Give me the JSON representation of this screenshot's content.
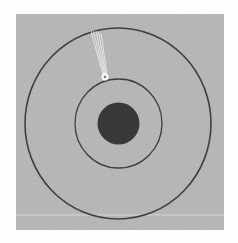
{
  "diagram": {
    "type": "orbit-diagram",
    "colors": {
      "page_background": "#fdfdfd",
      "panel": "#b6b6b6",
      "ring": "#3f3f3f",
      "nucleus": "#393939",
      "particle_glow": "#ffffff",
      "particle_core": "#8a8a8a",
      "streak": "#f2f2f2",
      "scan_line": "#d4d4d4"
    },
    "panel": {
      "x": 16,
      "y": 14,
      "width": 208,
      "height": 216
    },
    "nucleus": {
      "cx": 118.5,
      "cy": 123.5,
      "r": 21
    },
    "inner_orbit": {
      "cx": 118.5,
      "cy": 123.5,
      "rx": 43.5,
      "ry": 44.5,
      "stroke_width": 1.3
    },
    "outer_orbit": {
      "cx": 118,
      "cy": 123.5,
      "rx": 93,
      "ry": 95.5,
      "stroke_width": 1.6
    },
    "particle": {
      "cx": 105,
      "cy": 77,
      "glow_r": 4.2,
      "core_r": 1.4
    },
    "streaks": [
      {
        "x1": 91,
        "y1": 31,
        "x2": 103,
        "y2": 75
      },
      {
        "x1": 93.5,
        "y1": 31,
        "x2": 104,
        "y2": 75
      },
      {
        "x1": 96,
        "y1": 31,
        "x2": 105,
        "y2": 75
      },
      {
        "x1": 98.5,
        "y1": 32,
        "x2": 106,
        "y2": 75
      },
      {
        "x1": 101,
        "y1": 33,
        "x2": 107,
        "y2": 75
      }
    ],
    "scan_line": {
      "x1": 16,
      "y1": 215,
      "x2": 224,
      "y2": 215
    }
  }
}
